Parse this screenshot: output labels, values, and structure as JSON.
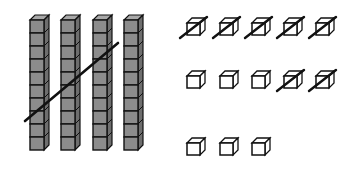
{
  "diagram": {
    "type": "base-ten-blocks",
    "colors": {
      "rod_fill": "#8c8c8c",
      "rod_top": "#a8a8a8",
      "rod_side": "#6e6e6e",
      "outline": "#111111",
      "unit_fill": "#ffffff",
      "strike": "#111111"
    },
    "tens": {
      "count": 4,
      "cubes_per_rod": 10,
      "crossed_out": 3,
      "rods": [
        {
          "x": 30,
          "crossed": true
        },
        {
          "x": 61,
          "crossed": true
        },
        {
          "x": 93,
          "crossed": true
        },
        {
          "x": 124,
          "crossed": false
        }
      ],
      "strike": {
        "x1": 25,
        "y1": 121,
        "x2": 118,
        "y2": 43
      }
    },
    "ones": {
      "count": 13,
      "crossed_out": 7,
      "rows": [
        {
          "y": 18,
          "units": [
            {
              "x": 187,
              "crossed": true
            },
            {
              "x": 220,
              "crossed": true
            },
            {
              "x": 252,
              "crossed": true
            },
            {
              "x": 284,
              "crossed": true
            },
            {
              "x": 316,
              "crossed": true
            }
          ]
        },
        {
          "y": 71,
          "units": [
            {
              "x": 187,
              "crossed": false
            },
            {
              "x": 220,
              "crossed": false
            },
            {
              "x": 252,
              "crossed": false
            },
            {
              "x": 284,
              "crossed": true
            },
            {
              "x": 316,
              "crossed": true
            }
          ]
        },
        {
          "y": 138,
          "units": [
            {
              "x": 187,
              "crossed": false
            },
            {
              "x": 220,
              "crossed": false
            },
            {
              "x": 252,
              "crossed": false
            }
          ]
        }
      ]
    },
    "summary": "4 tens and 13 ones; 3 tens and 7 ones crossed out"
  }
}
